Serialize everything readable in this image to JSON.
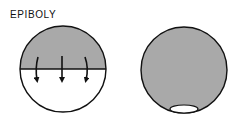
{
  "title": "EPIBOLY",
  "colors": {
    "shaded": "#a9a9a9",
    "outline": "#111111",
    "background": "#ffffff"
  },
  "panels": [
    {
      "name": "early-epiboly",
      "description": "Shaded cap covering upper hemisphere with three downward arrows",
      "arrows": 3
    },
    {
      "name": "late-epiboly",
      "description": "Fully shaded sphere with small white yolk plug at bottom"
    }
  ]
}
